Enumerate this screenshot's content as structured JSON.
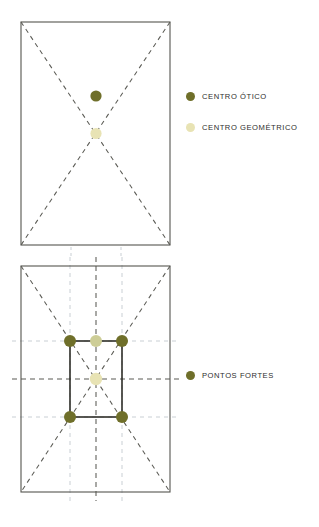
{
  "page": {
    "background": "#ffffff",
    "width": 319,
    "height": 527
  },
  "colors": {
    "dark_olive": "#6f6f2a",
    "cream": "#e8e3b4",
    "frame_stroke": "#55554f",
    "dash_stroke": "#5b5b55",
    "guide_stroke": "#c9cfd4",
    "text": "#2d2d2d"
  },
  "figures": [
    {
      "id": "figure-optical-center",
      "name": "optical-center-figure",
      "frame": {
        "x": 21,
        "y": 22,
        "width": 149,
        "height": 223
      },
      "diagonals": [
        {
          "from": [
            21,
            22
          ],
          "to": [
            170,
            245
          ]
        },
        {
          "from": [
            170,
            22
          ],
          "to": [
            21,
            245
          ]
        }
      ],
      "points": [
        {
          "name": "centro-otico-point",
          "x": 96,
          "y": 96,
          "r": 5.5,
          "color": "#6f6f2a"
        },
        {
          "name": "centro-geometrico-point",
          "x": 96,
          "y": 133,
          "r": 5.5,
          "color": "#e8e3b4"
        }
      ],
      "guides": [
        {
          "orientation": "vertical",
          "x": 71,
          "y1": 248,
          "y2": 258
        },
        {
          "orientation": "vertical",
          "x": 121,
          "y1": 248,
          "y2": 258
        }
      ]
    },
    {
      "id": "figure-strong-points",
      "name": "strong-points-figure",
      "frame": {
        "x": 21,
        "y": 266,
        "width": 149,
        "height": 226
      },
      "inner_rect": {
        "x": 70,
        "y": 341,
        "width": 52,
        "height": 76
      },
      "diagonals": [
        {
          "from": [
            21,
            266
          ],
          "to": [
            170,
            492
          ]
        },
        {
          "from": [
            170,
            266
          ],
          "to": [
            21,
            492
          ]
        }
      ],
      "center_dashes": [
        {
          "orientation": "vertical",
          "x": 96,
          "y1": 258,
          "y2": 500
        },
        {
          "orientation": "horizontal",
          "y": 379,
          "x1": 13,
          "x2": 178
        }
      ],
      "guides": [
        {
          "orientation": "vertical",
          "x": 70,
          "y1": 258,
          "y2": 500
        },
        {
          "orientation": "vertical",
          "x": 122,
          "y1": 258,
          "y2": 500
        },
        {
          "orientation": "horizontal",
          "y": 341,
          "x1": 13,
          "x2": 178
        },
        {
          "orientation": "horizontal",
          "y": 417,
          "x1": 13,
          "x2": 178
        }
      ],
      "points": [
        {
          "name": "ponto-forte-top-left",
          "x": 70,
          "y": 341,
          "r": 6,
          "color": "#6f6f2a"
        },
        {
          "name": "ponto-forte-top-center",
          "x": 96,
          "y": 341,
          "r": 6,
          "color": "#cfd09a"
        },
        {
          "name": "ponto-forte-top-right",
          "x": 122,
          "y": 341,
          "r": 6,
          "color": "#6f6f2a"
        },
        {
          "name": "centro-geometrico-point",
          "x": 96,
          "y": 379,
          "r": 6,
          "color": "#e8e3b4"
        },
        {
          "name": "ponto-forte-bottom-left",
          "x": 70,
          "y": 417,
          "r": 6,
          "color": "#6f6f2a"
        },
        {
          "name": "ponto-forte-bottom-right",
          "x": 122,
          "y": 417,
          "r": 6,
          "color": "#6f6f2a"
        }
      ]
    }
  ],
  "legend": {
    "optical": {
      "label": "CENTRO ÓTICO",
      "color": "#6f6f2a"
    },
    "geometric": {
      "label": "CENTRO GEOMÉTRICO",
      "color": "#e8e3b4"
    },
    "strong": {
      "label": "PONTOS FORTES",
      "color": "#6f6f2a"
    }
  }
}
